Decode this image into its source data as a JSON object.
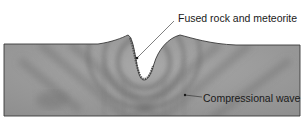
{
  "diagram": {
    "type": "cross-section",
    "labels": {
      "fused_rock": "Fused rock and meteorite",
      "compressional_wave": "Compressional wave"
    },
    "colors": {
      "ground": "#9a9a9a",
      "ground_dark": "#7d7d7d",
      "ground_light": "#b5b5b5",
      "outline": "#3a3a3a",
      "wave_band": "#6e6e6e",
      "text": "#1a1a1a",
      "background": "#ffffff"
    }
  }
}
